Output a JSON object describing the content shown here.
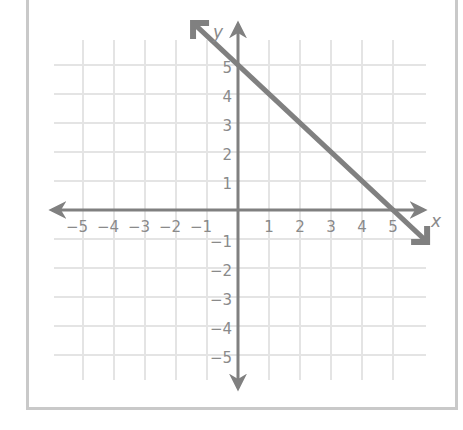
{
  "chart_data": {
    "type": "line",
    "title": "",
    "xlabel": "x",
    "ylabel": "y",
    "xlim": [
      -5,
      5
    ],
    "ylim": [
      -5,
      5
    ],
    "grid": true,
    "x_ticks": [
      "−5",
      "−4",
      "−3",
      "−2",
      "−1",
      "1",
      "2",
      "3",
      "4",
      "5"
    ],
    "y_ticks": [
      "5",
      "4",
      "3",
      "2",
      "1",
      "−1",
      "−2",
      "−3",
      "−4",
      "−5"
    ],
    "series": [
      {
        "name": "line",
        "equation": "y = -x + 5",
        "points": [
          [
            0,
            5
          ],
          [
            5,
            0
          ]
        ],
        "arrows": "both",
        "color": "#808080"
      }
    ]
  },
  "colors": {
    "grid": "#e4e4e4",
    "axis": "#808080",
    "line": "#808080",
    "frame": "#c9c9c9",
    "text": "#8a8a8a"
  }
}
